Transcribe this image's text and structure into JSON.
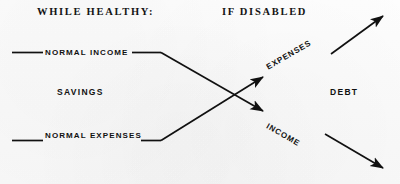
{
  "figure": {
    "background_color": "#fbfbfb",
    "ink_color": "#111111",
    "headings": {
      "left": "WHILE HEALTHY:",
      "right": "IF DISABLED"
    },
    "region_labels": {
      "left": "SAVINGS",
      "right": "DEBT"
    },
    "baseline_labels": {
      "income": "NORMAL INCOME",
      "expenses": "NORMAL EXPENSES"
    },
    "trend_labels": {
      "ascending": "EXPENSES",
      "descending": "INCOME"
    }
  }
}
